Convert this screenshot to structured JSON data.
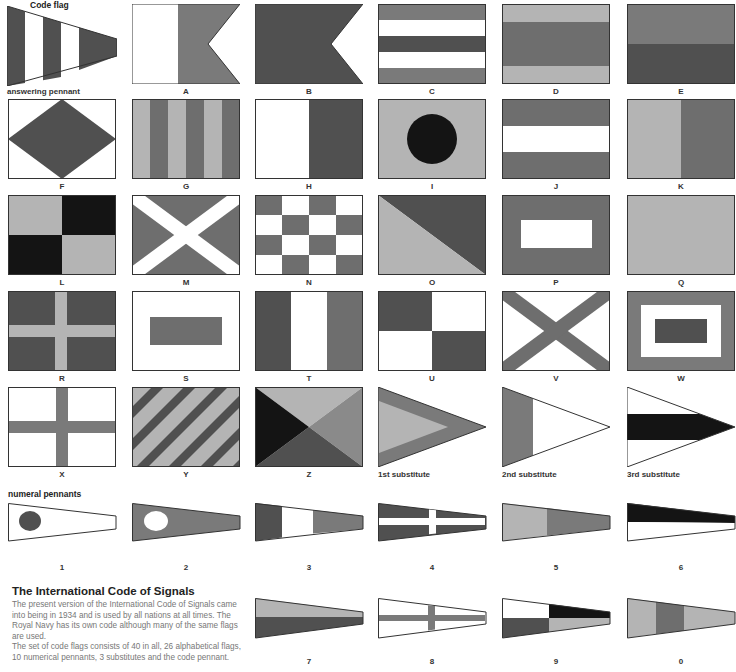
{
  "colors": {
    "red": "#7a7a7a",
    "blue": "#505050",
    "yellow": "#b4b4b4",
    "black": "#141414",
    "white": "#ffffff",
    "outline": "#333333"
  },
  "headers": {
    "code_flag": "Code flag",
    "answering_pennant": "answering pennant",
    "numeral_pennants": "numeral pennants"
  },
  "alphabet_flags": [
    {
      "label": "A"
    },
    {
      "label": "B"
    },
    {
      "label": "C"
    },
    {
      "label": "D"
    },
    {
      "label": "E"
    },
    {
      "label": "F"
    },
    {
      "label": "G"
    },
    {
      "label": "H"
    },
    {
      "label": "I"
    },
    {
      "label": "J"
    },
    {
      "label": "K"
    },
    {
      "label": "L"
    },
    {
      "label": "M"
    },
    {
      "label": "N"
    },
    {
      "label": "O"
    },
    {
      "label": "P"
    },
    {
      "label": "Q"
    },
    {
      "label": "R"
    },
    {
      "label": "S"
    },
    {
      "label": "T"
    },
    {
      "label": "U"
    },
    {
      "label": "V"
    },
    {
      "label": "W"
    },
    {
      "label": "X"
    },
    {
      "label": "Y"
    },
    {
      "label": "Z"
    }
  ],
  "substitutes": [
    {
      "label": "1st substitute"
    },
    {
      "label": "2nd substitute"
    },
    {
      "label": "3rd substitute"
    }
  ],
  "numerals": [
    {
      "label": "1"
    },
    {
      "label": "2"
    },
    {
      "label": "3"
    },
    {
      "label": "4"
    },
    {
      "label": "5"
    },
    {
      "label": "6"
    },
    {
      "label": "7"
    },
    {
      "label": "8"
    },
    {
      "label": "9"
    },
    {
      "label": "0"
    }
  ],
  "article": {
    "title": "The International Code of Signals",
    "paragraph1": "The present version of the International Code of Signals came into being in 1934 and is used by all nations at all times. The Royal Navy has its own code although many of the same flags are used.",
    "paragraph2": "The set of code flags consists of 40 in all, 26 alphabetical flags, 10 numerical pennants, 3 substitutes and the code pennant."
  }
}
